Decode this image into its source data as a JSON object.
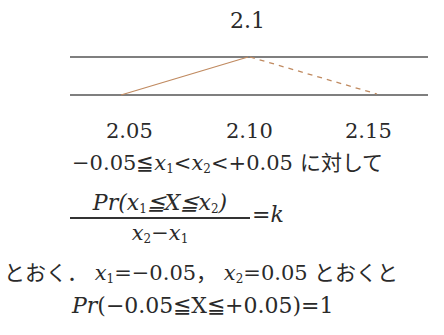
{
  "diagram": {
    "peak_label": "2.1",
    "ticks": [
      "2.05",
      "2.10",
      "2.15"
    ],
    "colors": {
      "rails": "#555555",
      "solid_segment": "#c08a60",
      "dashed_segment": "#c08a60"
    }
  },
  "text": {
    "condition_prefix": "−0.05≦",
    "x1": "x",
    "x1_sub": "1",
    "lt1": "<",
    "x2": "x",
    "x2_sub": "2",
    "condition_suffix": "<+0.05",
    "condition_tail": " に対して",
    "fraction": {
      "numerator_pr": "Pr",
      "numerator_body_a": "(x",
      "numerator_sub1": "1",
      "numerator_body_b": "≦X≦x",
      "numerator_sub2": "2",
      "numerator_close": ")",
      "denominator_a": "x",
      "denominator_sub2": "2",
      "denominator_minus": "−x",
      "denominator_sub1": "1",
      "equals_k": "=k"
    },
    "line3_a": "とおく．",
    "line3_x1": "x",
    "line3_x1_sub": "1",
    "line3_b": "=−0.05，",
    "line3_x2": "x",
    "line3_x2_sub": "2",
    "line3_c": "=0.05 とおくと",
    "line4_pr": "Pr",
    "line4_body": "(−0.05≦X≦+0.05)=1"
  }
}
